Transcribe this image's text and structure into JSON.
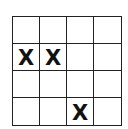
{
  "board": {
    "rows": 4,
    "cols": 4,
    "cells": [
      [
        "",
        "",
        "",
        ""
      ],
      [
        "X",
        "X",
        "",
        ""
      ],
      [
        "",
        "",
        "",
        ""
      ],
      [
        "",
        "",
        "X",
        ""
      ]
    ]
  }
}
